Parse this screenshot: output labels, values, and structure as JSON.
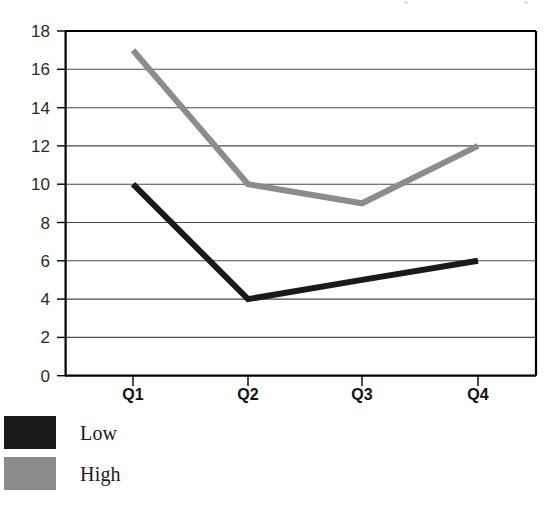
{
  "chart_data": {
    "type": "line",
    "title": "",
    "subtitle": "",
    "xlabel": "",
    "ylabel": "",
    "categories": [
      "Q1",
      "Q2",
      "Q3",
      "Q4"
    ],
    "series": [
      {
        "name": "Low",
        "values": [
          10,
          4,
          5,
          6
        ],
        "color": "#1a1a1a"
      },
      {
        "name": "High",
        "values": [
          17,
          10,
          9,
          12
        ],
        "color": "#8c8c8c"
      }
    ],
    "ylim": [
      0,
      18
    ],
    "ytick_step": 2,
    "yticks": [
      "0",
      "2",
      "4",
      "6",
      "8",
      "10",
      "12",
      "14",
      "16",
      "18"
    ],
    "grid": true,
    "grid_axis": "y",
    "legend_position": "bottom-left"
  },
  "legend": {
    "items": [
      {
        "label": "Low",
        "color": "#1a1a1a"
      },
      {
        "label": "High",
        "color": "#8c8c8c"
      }
    ]
  },
  "axes": {
    "y_tick_labels": [
      "18",
      "16",
      "14",
      "12",
      "10",
      "8",
      "6",
      "4",
      "2",
      "0"
    ],
    "x_tick_labels": [
      "Q1",
      "Q2",
      "Q3",
      "Q4"
    ]
  },
  "colors": {
    "series_low": "#1a1a1a",
    "series_high": "#8c8c8c",
    "axis": "#000000",
    "grid": "#4a4a4a",
    "background": "#ffffff"
  }
}
